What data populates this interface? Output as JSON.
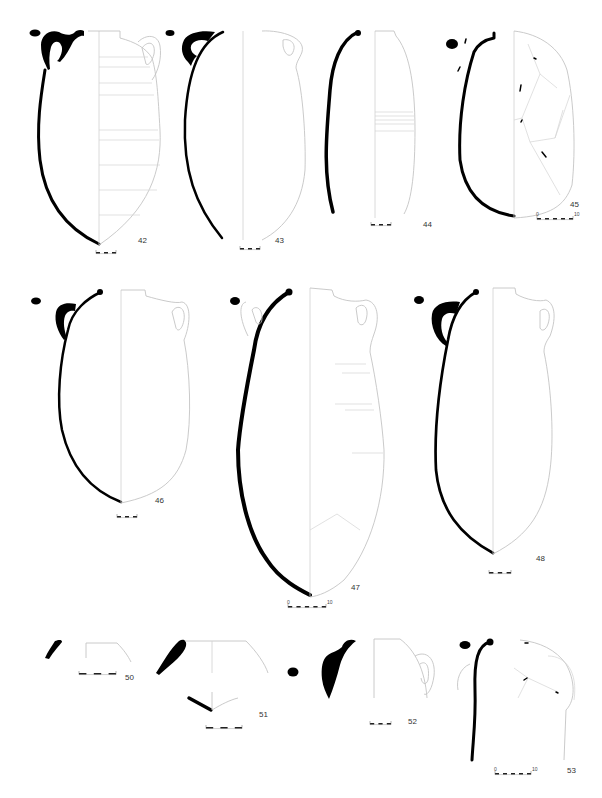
{
  "figure": {
    "type": "amphora profile drawings plate",
    "colors": {
      "section": "#000000",
      "outline": "#c8c8c8",
      "axis": "#cfcfcf",
      "label": "#333333"
    }
  },
  "items": [
    {
      "id": "42",
      "label": "42",
      "label_pos": [
        138,
        236
      ],
      "scale": {
        "x": 96,
        "y": 253,
        "w": 20,
        "segments": 3,
        "start": "",
        "end": ""
      }
    },
    {
      "id": "43",
      "label": "43",
      "label_pos": [
        275,
        236
      ],
      "scale": {
        "x": 240,
        "y": 249,
        "w": 20,
        "segments": 3,
        "start": "",
        "end": ""
      }
    },
    {
      "id": "44",
      "label": "44",
      "label_pos": [
        423,
        220
      ],
      "scale": {
        "x": 371,
        "y": 225,
        "w": 20,
        "segments": 3,
        "start": "",
        "end": ""
      }
    },
    {
      "id": "45",
      "label": "45",
      "label_pos": [
        570,
        200
      ],
      "scale": {
        "x": 537,
        "y": 219,
        "w": 36,
        "segments": 5,
        "start": "0",
        "end": "10"
      }
    },
    {
      "id": "46",
      "label": "46",
      "label_pos": [
        155,
        496
      ],
      "scale": {
        "x": 117,
        "y": 517,
        "w": 20,
        "segments": 3,
        "start": "",
        "end": ""
      }
    },
    {
      "id": "47",
      "label": "47",
      "label_pos": [
        351,
        583
      ],
      "scale": {
        "x": 288,
        "y": 607,
        "w": 38,
        "segments": 5,
        "start": "0",
        "end": "10"
      }
    },
    {
      "id": "48",
      "label": "48",
      "label_pos": [
        536,
        554
      ],
      "scale": {
        "x": 489,
        "y": 573,
        "w": 22,
        "segments": 3,
        "start": "",
        "end": ""
      }
    },
    {
      "id": "50",
      "label": "50",
      "label_pos": [
        125,
        673
      ],
      "scale": {
        "x": 79,
        "y": 674,
        "w": 37,
        "segments": 3,
        "start": "",
        "end": ""
      }
    },
    {
      "id": "51",
      "label": "51",
      "label_pos": [
        259,
        710
      ],
      "scale": {
        "x": 206,
        "y": 728,
        "w": 36,
        "segments": 3,
        "start": "",
        "end": ""
      }
    },
    {
      "id": "52",
      "label": "52",
      "label_pos": [
        408,
        717
      ],
      "scale": {
        "x": 370,
        "y": 724,
        "w": 21,
        "segments": 3,
        "start": "",
        "end": ""
      }
    },
    {
      "id": "53",
      "label": "53",
      "label_pos": [
        567,
        766
      ],
      "scale": {
        "x": 495,
        "y": 774,
        "w": 36,
        "segments": 5,
        "start": "0",
        "end": "10"
      }
    }
  ]
}
